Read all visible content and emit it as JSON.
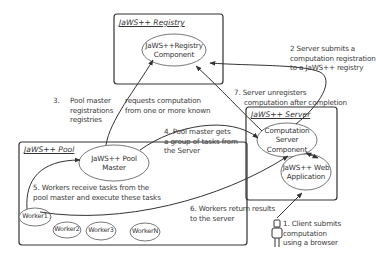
{
  "diagram": {
    "containers": {
      "registry": {
        "title": "JaWS++ Registry"
      },
      "pool": {
        "title": "JaWS++ Pool"
      },
      "server": {
        "title": "JaWS++ Server"
      }
    },
    "nodes": {
      "registry_component": "JaWS++Registry\nComponent",
      "pool_master": "JaWS++ Pool\nMaster",
      "computation_server": "Computation\nServer Component",
      "web_application": "JaWS++ Web\nApplication",
      "workers": [
        "Worker1",
        "Worker2",
        "Worker3",
        "WorkerN"
      ]
    },
    "steps": {
      "step1": [
        "1. Client submits",
        "computation",
        "using a browser"
      ],
      "step2": [
        "2 Server  submits a",
        "computation registration",
        "to a JaWS++ registry"
      ],
      "step3_num": "3.",
      "step3": [
        "Pool master",
        "registrations",
        "registries"
      ],
      "step3b": [
        "requests computation",
        "from one or more known"
      ],
      "step4": [
        "4. Pool master gets",
        "a group of tasks from",
        "the Server"
      ],
      "step5": [
        "5. Workers receive tasks from the",
        "pool  master and execute these tasks"
      ],
      "step6": [
        "6. Workers return results",
        "to the server"
      ],
      "step7": [
        "7. Server unregisters",
        "computation after completion"
      ]
    },
    "actor": {
      "icon": "person-icon",
      "role": "Client"
    }
  }
}
